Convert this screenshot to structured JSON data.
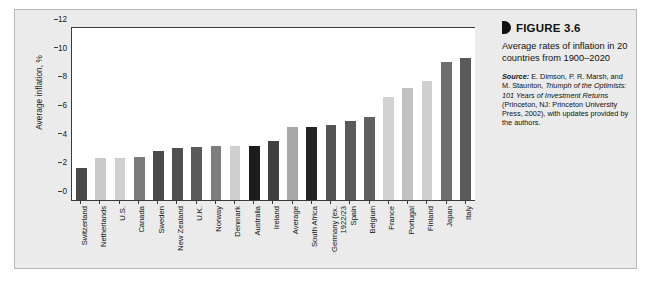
{
  "figure": {
    "marker_icon": "triangle-right-icon",
    "title": "FIGURE 3.6",
    "subtitle": "Average rates of inflation in 20 countries from 1900–2020",
    "source_label": "Source:",
    "source_part1": " E. Dimson, P. R. Marsh, and M. Staunton, ",
    "source_italic": "Triumph of the Optimists: 101 Years of Investment Returns",
    "source_part2": " (Princeton, NJ: Princeton University Press, 2002), with updates provided by the authors."
  },
  "colors": {
    "panel_bg": "#ebebeb",
    "plot_bg": "#ffffff",
    "axis": "#3a3a3a",
    "bar_dark": "#3d3d3d",
    "bar_black": "#1c1c1c",
    "bar_mid": "#707070",
    "bar_light": "#c8c8c8",
    "bar_lighter": "#d8d8d8"
  },
  "chart_data": {
    "type": "bar",
    "title": "Average rates of inflation in 20 countries from 1900–2020",
    "xlabel": "",
    "ylabel": "Average inflation, %",
    "ylim": [
      0,
      12
    ],
    "yticks": [
      0,
      2,
      4,
      6,
      8,
      10,
      12
    ],
    "grid": false,
    "legend": "none",
    "categories": [
      "Switzerland",
      "Netherlands",
      "U.S.",
      "Canada",
      "Sweden",
      "New Zealand",
      "U.K.",
      "Norway",
      "Denmark",
      "Australia",
      "Ireland",
      "Average",
      "South Africa",
      "Germany (ex. 1922/23)",
      "Spain",
      "Belgium",
      "France",
      "Portugal",
      "Finland",
      "Japan",
      "Italy"
    ],
    "values": [
      2.2,
      2.9,
      2.95,
      3.0,
      3.45,
      3.6,
      3.7,
      3.75,
      3.75,
      3.75,
      4.1,
      5.1,
      5.1,
      5.2,
      5.5,
      5.8,
      7.2,
      7.8,
      8.3,
      9.6,
      9.9
    ],
    "bar_colors": [
      "#4a4a4a",
      "#c9c9c9",
      "#cfcfcf",
      "#7a7a7a",
      "#4a4a4a",
      "#4f4f4f",
      "#5a5a5a",
      "#7d7d7d",
      "#cfcfcf",
      "#1c1c1c",
      "#3f3f3f",
      "#a8a8a8",
      "#232323",
      "#545454",
      "#5a5a5a",
      "#5f5f5f",
      "#d2d2d2",
      "#c2c2c2",
      "#cfcfcf",
      "#6e6e6e",
      "#5a5a5a"
    ],
    "label_lines": [
      [
        "Switzerland"
      ],
      [
        "Netherlands"
      ],
      [
        "U.S."
      ],
      [
        "Canada"
      ],
      [
        "Sweden"
      ],
      [
        "New Zealand"
      ],
      [
        "U.K."
      ],
      [
        "Norway"
      ],
      [
        "Denmark"
      ],
      [
        "Australia"
      ],
      [
        "Ireland"
      ],
      [
        "Average"
      ],
      [
        "South Africa"
      ],
      [
        "Germany (ex.",
        "1922/23"
      ],
      [
        "Spain"
      ],
      [
        "Belgium"
      ],
      [
        "France"
      ],
      [
        "Portugal"
      ],
      [
        "Finland"
      ],
      [
        "Japan"
      ],
      [
        "Italy"
      ]
    ]
  }
}
